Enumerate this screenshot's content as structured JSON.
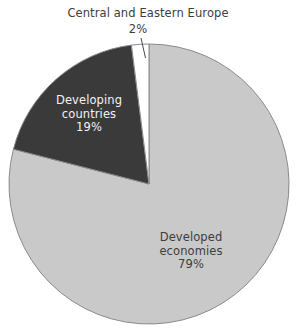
{
  "chart_data": {
    "type": "pie",
    "title": "",
    "categories": [
      "Developed economies",
      "Developing countries",
      "Central and Eastern Europe"
    ],
    "values": [
      79,
      19,
      2
    ],
    "unit": "%",
    "legend": "none",
    "start_angle_deg": 0,
    "direction": "clockwise",
    "slices": [
      {
        "label": "Developed economies",
        "value": 79,
        "value_text": "79%",
        "color": "#c9c9c9",
        "text_color": "#3d3d3d",
        "label_placement": "inside",
        "label_line1": "Developed",
        "label_line2": "economies"
      },
      {
        "label": "Developing countries",
        "value": 19,
        "value_text": "19%",
        "color": "#3a3a3a",
        "text_color": "#f2f2f2",
        "label_placement": "inside",
        "label_line1": "Developing",
        "label_line2": "countries"
      },
      {
        "label": "Central and Eastern Europe",
        "value": 2,
        "value_text": "2%",
        "color": "#ffffff",
        "text_color": "#3d3d3d",
        "label_placement": "outside",
        "label_line1": "Central and Eastern Europe",
        "label_line2": ""
      }
    ],
    "colors": {
      "developed": "#c9c9c9",
      "developing": "#3a3a3a",
      "cee": "#ffffff",
      "outline": "#8a8a8a",
      "background": "#ffffff",
      "label_dark": "#3d3d3d",
      "label_light": "#f2f2f2"
    }
  },
  "labels": {
    "cee_title": "Central and Eastern Europe",
    "cee_value": "2%",
    "developing_line1": "Developing",
    "developing_line2": "countries",
    "developing_value": "19%",
    "developed_line1": "Developed",
    "developed_line2": "economies",
    "developed_value": "79%"
  }
}
